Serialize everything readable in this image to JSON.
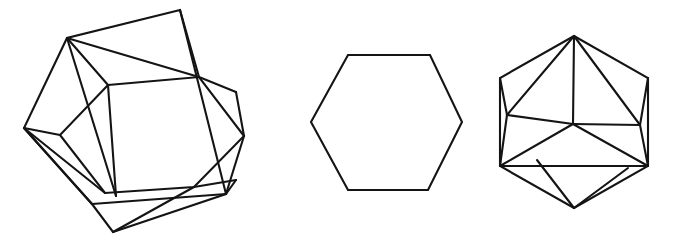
{
  "figure": {
    "background_color": "#ffffff",
    "stroke_color": "#141414",
    "stroke_width": 2.1,
    "canvas": {
      "width": 674,
      "height": 240
    },
    "panels": [
      {
        "id": "left",
        "name": "unfolded-hexagon-with-rotated-inner-hexagon",
        "description": "Outer hexagon with an inscribed rotated hexagon; the six corner regions are each subdivided by extra creases",
        "outer_hexagon": [
          [
            180,
            10
          ],
          [
            67,
            38
          ],
          [
            24,
            128
          ],
          [
            92,
            204
          ],
          [
            113,
            232
          ],
          [
            226,
            194
          ]
        ],
        "inner_hexagon": [
          [
            108,
            85
          ],
          [
            199,
            77
          ],
          [
            244,
            136
          ],
          [
            194,
            187
          ],
          [
            105,
            193
          ],
          [
            60,
            135
          ]
        ],
        "creases": [
          [
            [
              67,
              38
            ],
            [
              108,
              85
            ]
          ],
          [
            [
              67,
              38
            ],
            [
              116,
              196
            ]
          ],
          [
            [
              108,
              85
            ],
            [
              116,
              196
            ]
          ],
          [
            [
              108,
              85
            ],
            [
              67,
              38
            ]
          ],
          [
            [
              180,
              10
            ],
            [
              199,
              77
            ]
          ],
          [
            [
              199,
              77
            ],
            [
              67,
              38
            ]
          ],
          [
            [
              244,
              136
            ],
            [
              226,
              194
            ]
          ],
          [
            [
              24,
              128
            ],
            [
              105,
              193
            ]
          ],
          [
            [
              24,
              128
            ],
            [
              60,
              135
            ]
          ],
          [
            [
              113,
              232
            ],
            [
              194,
              187
            ]
          ],
          [
            [
              226,
              194
            ],
            [
              105,
              193
            ]
          ],
          [
            [
              244,
              136
            ],
            [
              199,
              77
            ]
          ]
        ]
      },
      {
        "id": "middle",
        "name": "plain-hexagon",
        "description": "A single plain regular hexagon outline",
        "hexagon": [
          [
            348,
            55
          ],
          [
            430,
            55
          ],
          [
            462,
            122
          ],
          [
            428,
            190
          ],
          [
            348,
            190
          ],
          [
            311,
            122
          ]
        ]
      },
      {
        "id": "right",
        "name": "hexagon-with-inscribed-cube",
        "description": "Hexagon containing an inscribed cube projection plus folded flaps",
        "hexagon": [
          [
            574,
            36
          ],
          [
            648,
            78
          ],
          [
            648,
            166
          ],
          [
            574,
            208
          ],
          [
            500,
            166
          ],
          [
            500,
            78
          ]
        ],
        "cube_center": [
          573,
          124
        ],
        "cube_spokes": [
          [
            [
              573,
              124
            ],
            [
              574,
              36
            ]
          ],
          [
            [
              573,
              124
            ],
            [
              500,
              166
            ]
          ],
          [
            [
              573,
              124
            ],
            [
              648,
              166
            ]
          ]
        ],
        "creases": [
          [
            [
              574,
              36
            ],
            [
              507,
              115
            ]
          ],
          [
            [
              507,
              115
            ],
            [
              500,
              78
            ]
          ],
          [
            [
              507,
              115
            ],
            [
              500,
              166
            ]
          ],
          [
            [
              574,
              36
            ],
            [
              640,
              125
            ]
          ],
          [
            [
              640,
              125
            ],
            [
              648,
              78
            ]
          ],
          [
            [
              640,
              125
            ],
            [
              648,
              166
            ]
          ],
          [
            [
              500,
              166
            ],
            [
              631,
              166
            ]
          ],
          [
            [
              574,
              208
            ],
            [
              537,
              160
            ]
          ],
          [
            [
              537,
              160
            ],
            [
              500,
              166
            ]
          ],
          [
            [
              574,
              208
            ],
            [
              621,
              170
            ]
          ],
          [
            [
              507,
              115
            ],
            [
              573,
              124
            ]
          ],
          [
            [
              640,
              125
            ],
            [
              573,
              124
            ]
          ]
        ]
      }
    ]
  }
}
